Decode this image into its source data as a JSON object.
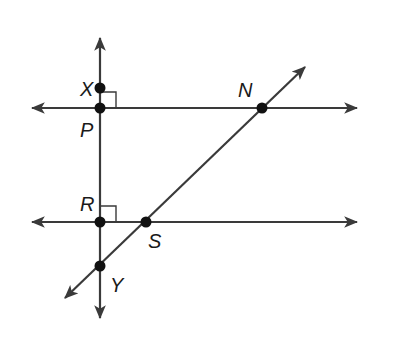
{
  "diagram": {
    "type": "geometry-lines",
    "colors": {
      "line": "#3a3a3a",
      "point": "#111111",
      "label": "#1a1a1a",
      "background": "#ffffff"
    },
    "lines": [
      {
        "id": "vertical-line",
        "from": [
          100,
          318
        ],
        "to": [
          100,
          38
        ],
        "arrows": "both"
      },
      {
        "id": "top-horizontal-line",
        "from": [
          32,
          108
        ],
        "to": [
          357,
          108
        ],
        "arrows": "both"
      },
      {
        "id": "bottom-horizontal-line",
        "from": [
          32,
          222
        ],
        "to": [
          357,
          222
        ],
        "arrows": "both"
      },
      {
        "id": "transversal-line",
        "from": [
          65,
          298
        ],
        "to": [
          305,
          67
        ],
        "arrows": "both"
      }
    ],
    "points": [
      {
        "name": "X",
        "x": 100,
        "y": 88,
        "label": "X",
        "lx": 80,
        "ly": 96
      },
      {
        "name": "P",
        "x": 100,
        "y": 108,
        "label": "P",
        "lx": 80,
        "ly": 137
      },
      {
        "name": "N",
        "x": 262,
        "y": 108,
        "label": "N",
        "lx": 238,
        "ly": 97
      },
      {
        "name": "R",
        "x": 100,
        "y": 222,
        "label": "R",
        "lx": 80,
        "ly": 211
      },
      {
        "name": "S",
        "x": 146,
        "y": 222,
        "label": "S",
        "lx": 148,
        "ly": 248
      },
      {
        "name": "Y",
        "x": 100,
        "y": 266,
        "label": "Y",
        "lx": 110,
        "ly": 292
      }
    ],
    "right_angle_marks": [
      {
        "at": "P",
        "x": 100,
        "y": 108,
        "size": 16
      },
      {
        "at": "R",
        "x": 100,
        "y": 222,
        "size": 16
      }
    ]
  }
}
